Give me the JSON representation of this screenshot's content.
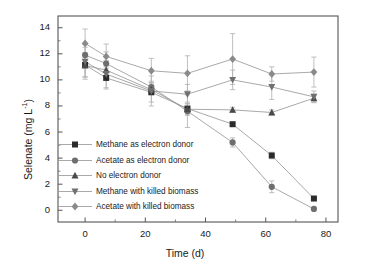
{
  "chart_data": {
    "type": "line",
    "title": "",
    "xlabel": "Time (d)",
    "ylabel": "Selenate (mg L⁻¹)",
    "ylabel_base": "Selenate (mg L",
    "ylabel_sup": "-1",
    "ylabel_close": ")",
    "xlim": [
      -9,
      84
    ],
    "ylim": [
      -0.9,
      14.9
    ],
    "xticks": [
      0,
      20,
      40,
      60,
      80
    ],
    "yticks": [
      0,
      2,
      4,
      6,
      8,
      10,
      12,
      14
    ],
    "grid": false,
    "legend_position": "center-left",
    "x": [
      0,
      7,
      22,
      34,
      49,
      62,
      76
    ],
    "series": [
      {
        "name": "Methane as electron donor",
        "marker": "square",
        "color": "#2b2b2b",
        "values": [
          11.15,
          10.15,
          9.05,
          7.8,
          6.6,
          4.2,
          0.9
        ],
        "errors": [
          0.95,
          0.85,
          0.75,
          0.5,
          0.15,
          0.25,
          0.15
        ]
      },
      {
        "name": "Acetate as electron donor",
        "marker": "circle",
        "color": "#6e6e6e",
        "values": [
          11.9,
          11.25,
          9.45,
          7.6,
          5.2,
          1.8,
          0.1
        ],
        "errors": [
          0.6,
          0.9,
          0.45,
          1.25,
          0.35,
          0.45,
          0.1
        ]
      },
      {
        "name": "No electron donor",
        "marker": "triangle-up",
        "color": "#4a4a4a",
        "values": [
          11.1,
          10.75,
          9.25,
          7.75,
          7.7,
          7.5,
          8.6
        ],
        "errors": [
          0.85,
          0.55,
          0.35,
          0.45,
          0.2,
          0.2,
          0.3
        ]
      },
      {
        "name": "Methane with killed biomass",
        "marker": "triangle-down",
        "color": "#707070",
        "values": [
          11.4,
          10.45,
          9.15,
          8.9,
          10.0,
          9.45,
          8.7
        ],
        "errors": [
          1.35,
          1.05,
          1.15,
          0.75,
          0.75,
          0.95,
          0.45
        ]
      },
      {
        "name": "Acetate with killed biomass",
        "marker": "diamond",
        "color": "#8a8a8a",
        "values": [
          12.8,
          11.8,
          10.7,
          10.5,
          11.6,
          10.45,
          10.6
        ],
        "errors": [
          1.1,
          0.95,
          0.95,
          1.35,
          1.95,
          0.55,
          1.15
        ]
      }
    ]
  },
  "legend": {
    "items": [
      "Methane as electron donor",
      "Acetate as electron donor",
      "No electron donor",
      "Methane with killed biomass",
      "Acetate with killed biomass"
    ]
  },
  "axes": {
    "x_tick_labels": [
      "0",
      "20",
      "40",
      "60",
      "80"
    ],
    "y_tick_labels": [
      "0",
      "2",
      "4",
      "6",
      "8",
      "10",
      "12",
      "14"
    ]
  }
}
